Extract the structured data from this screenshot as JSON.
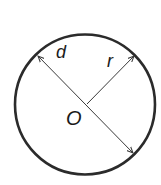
{
  "diagram": {
    "colors": {
      "circle_stroke": "#2b2b2b",
      "line_stroke": "#3a3a3a",
      "label": "#1a1a1a",
      "background": "#ffffff"
    },
    "circle": {
      "cx": 85,
      "cy": 104.5,
      "r": 70
    },
    "labels": {
      "diameter": "d",
      "radius": "r",
      "center": "O"
    },
    "segments": [
      {
        "name": "diameter",
        "label": "d",
        "from": [
          37,
          55
        ],
        "to": [
          134,
          154
        ],
        "arrows": "both"
      },
      {
        "name": "radius",
        "label": "r",
        "from": [
          87,
          104
        ],
        "to": [
          135,
          55
        ],
        "arrows": "end"
      }
    ]
  }
}
